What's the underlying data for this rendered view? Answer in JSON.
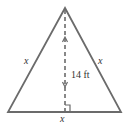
{
  "diagram": {
    "shape": "isosceles-triangle",
    "colors": {
      "triangle_stroke": "#6b6b6b",
      "altitude_stroke": "#6b6b6b",
      "label_color": "#333333",
      "background": "#ffffff"
    },
    "labels": {
      "left_side": "x",
      "right_side": "x",
      "base": "x",
      "height": "14 ft"
    }
  }
}
